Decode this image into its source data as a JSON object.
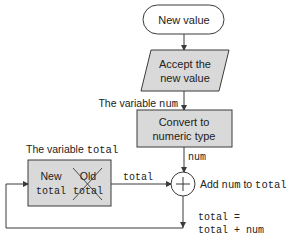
{
  "colors": {
    "box_fill": "#d9d9d9",
    "stroke": "#3a3a3a",
    "text": "#222222",
    "background": "#ffffff"
  },
  "nodes": {
    "start": {
      "label": "New value",
      "shape": "terminator"
    },
    "input": {
      "line1": "Accept the",
      "line2": "new value",
      "shape": "parallelogram"
    },
    "convert": {
      "line1": "Convert to",
      "line2": "numeric type",
      "shape": "process"
    },
    "sum": {
      "symbol": "+",
      "shape": "summing-junction"
    },
    "total_box": {
      "new_label": "New",
      "new_var": "total",
      "old_label": "Old",
      "old_var": "total",
      "shape": "storage"
    }
  },
  "labels": {
    "variable_num_prefix": "The variable ",
    "variable_num_name": "num",
    "variable_total_prefix": "The variable ",
    "variable_total_name": "total",
    "edge_num": "num",
    "edge_total": "total",
    "add_prefix": "Add ",
    "add_num": "num",
    "add_mid": " to ",
    "add_total": "total",
    "formula_line1": "total =",
    "formula_line2": "total + num"
  }
}
